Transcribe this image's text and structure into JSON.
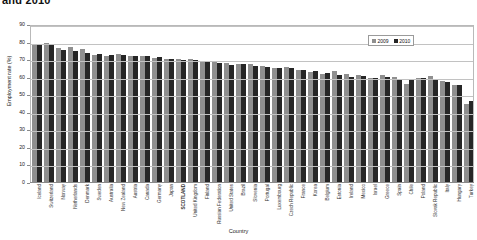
{
  "chart_data": {
    "type": "bar",
    "title": "and 2010",
    "xlabel": "Country",
    "ylabel": "Employment rate (%)",
    "ylim": [
      0,
      90
    ],
    "ytick_step": 10,
    "yticks": [
      0,
      10,
      20,
      30,
      40,
      50,
      60,
      70,
      80,
      90
    ],
    "grid": true,
    "legend_position": "top-right",
    "categories": [
      "Iceland",
      "Switzerland",
      "Norway",
      "Netherlands",
      "Denmark",
      "Sweden",
      "Australia",
      "New Zealand",
      "Austria",
      "Canada",
      "Germany",
      "Japan",
      "SCOTLAND",
      "United Kingdom",
      "Finland",
      "Russian Federation",
      "United States",
      "Brazil",
      "Slovenia",
      "Portugal",
      "Luxembourg",
      "Czech Republic",
      "France",
      "Korea",
      "Belgium",
      "Estonia",
      "Ireland",
      "Mexico",
      "Israel",
      "Greece",
      "Spain",
      "Chile",
      "Poland",
      "Slovak Republic",
      "Italy",
      "Hungary",
      "Turkey"
    ],
    "series": [
      {
        "name": "2009",
        "color": "#8f8f8f",
        "values": [
          78.3,
          79.0,
          76.4,
          77.0,
          75.7,
          72.2,
          72.0,
          72.9,
          71.6,
          71.5,
          70.9,
          70.0,
          70.2,
          69.9,
          68.7,
          68.3,
          67.6,
          67.0,
          67.5,
          66.3,
          65.2,
          65.4,
          64.0,
          62.9,
          61.6,
          63.5,
          61.8,
          60.9,
          59.2,
          61.2,
          59.8,
          56.0,
          59.3,
          60.2,
          57.5,
          55.4,
          44.3
        ]
      },
      {
        "name": "2010",
        "color": "#262626",
        "values": [
          78.2,
          78.6,
          75.3,
          74.7,
          73.4,
          72.7,
          72.4,
          72.3,
          71.7,
          71.5,
          71.1,
          70.1,
          69.7,
          69.5,
          68.1,
          67.7,
          66.7,
          67.2,
          66.2,
          65.6,
          65.2,
          65.0,
          63.8,
          63.3,
          62.0,
          61.0,
          60.0,
          60.3,
          59.2,
          59.6,
          58.6,
          58.0,
          59.3,
          58.8,
          56.9,
          55.4,
          46.3
        ]
      }
    ]
  }
}
